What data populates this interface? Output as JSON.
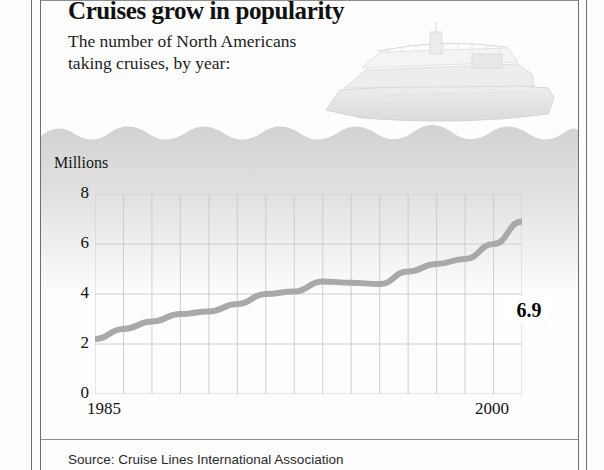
{
  "headline": "Cruises grow in popularity",
  "subhead_line1": "The number of North Americans",
  "subhead_line2": "taking cruises, by year:",
  "source": "Source: Cruise Lines International Association",
  "axis_title": "Millions",
  "icons": {
    "ship": "cruise-ship-illustration",
    "water": "water-waves"
  },
  "colors": {
    "line": "#a9a9a9",
    "grid": "#c9c9c9",
    "water": "#d8d8d8",
    "text": "#111111"
  },
  "chart_data": {
    "type": "line",
    "title": "Cruises grow in popularity",
    "subtitle": "The number of North Americans taking cruises, by year:",
    "xlabel": "",
    "ylabel": "Millions",
    "xlim": [
      1985,
      2000
    ],
    "ylim": [
      0,
      8
    ],
    "yticks": [
      0,
      2,
      4,
      6,
      8
    ],
    "xticks": [
      1985,
      2000
    ],
    "xtick_labels": [
      "1985",
      "2000"
    ],
    "grid": true,
    "legend": "none",
    "x": [
      1985,
      1986,
      1987,
      1988,
      1989,
      1990,
      1991,
      1992,
      1993,
      1994,
      1995,
      1996,
      1997,
      1998,
      1999,
      2000
    ],
    "values": [
      2.2,
      2.6,
      2.9,
      3.2,
      3.3,
      3.6,
      4.0,
      4.1,
      4.5,
      4.45,
      4.4,
      4.9,
      5.2,
      5.4,
      6.0,
      6.9
    ],
    "annotations": [
      {
        "label": "2.2",
        "x": 1985,
        "y": 2.2,
        "position": "below-right"
      },
      {
        "label": "6.9",
        "x": 2000,
        "y": 6.9,
        "position": "above-left",
        "style": "folded-callout"
      }
    ]
  }
}
